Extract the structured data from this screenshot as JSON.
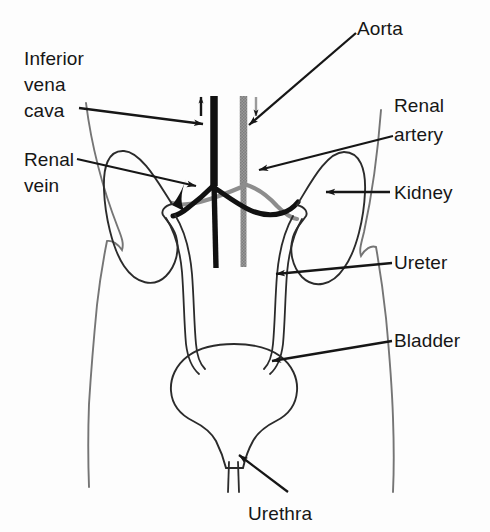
{
  "figure": {
    "background_color": "#fdfdfd",
    "ink_color": "#161616",
    "vein_color": "#111111",
    "artery_color": "#8d8d8d",
    "outline_color": "#6f6f6f",
    "organ_color": "#2b2b2b"
  },
  "labels": {
    "inferior_vena_cava_line1": "Inferior",
    "inferior_vena_cava_line2": "vena",
    "inferior_vena_cava_line3": "cava",
    "renal_vein_line1": "Renal",
    "renal_vein_line2": "vein",
    "aorta": "Aorta",
    "renal_artery_line1": "Renal",
    "renal_artery_line2": "artery",
    "kidney": "Kidney",
    "ureter": "Ureter",
    "bladder": "Bladder",
    "urethra": "Urethra"
  },
  "flow_markers": {
    "vena_cava_direction": "up",
    "aorta_direction": "down"
  },
  "structures": [
    {
      "name": "inferior-vena-cava",
      "style": "solid-black",
      "side": "left-of-midline"
    },
    {
      "name": "aorta",
      "style": "gray-stippled",
      "side": "right-of-midline"
    },
    {
      "name": "renal-vein-left",
      "style": "solid-black"
    },
    {
      "name": "renal-vein-right",
      "style": "solid-black"
    },
    {
      "name": "renal-artery-left",
      "style": "gray"
    },
    {
      "name": "renal-artery-right",
      "style": "gray"
    },
    {
      "name": "kidney-left",
      "style": "outline"
    },
    {
      "name": "kidney-right",
      "style": "outline"
    },
    {
      "name": "ureter-left",
      "style": "double-line"
    },
    {
      "name": "ureter-right",
      "style": "double-line"
    },
    {
      "name": "bladder",
      "style": "outline"
    },
    {
      "name": "urethra",
      "style": "double-line"
    },
    {
      "name": "torso-outline-left",
      "style": "thin-gray"
    },
    {
      "name": "torso-outline-right",
      "style": "thin-gray"
    }
  ]
}
